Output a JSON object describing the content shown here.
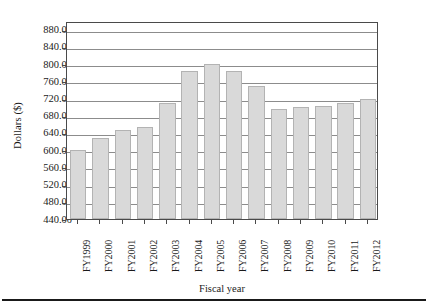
{
  "chart_data": {
    "type": "bar",
    "title": "",
    "xlabel": "Fiscal year",
    "ylabel": "Dollars ($)",
    "categories": [
      "FY1999",
      "FY2000",
      "FY2001",
      "FY2002",
      "FY2003",
      "FY2004",
      "FY2005",
      "FY2006",
      "FY2007",
      "FY2008",
      "FY2009",
      "FY2010",
      "FY2011",
      "FY2012"
    ],
    "values": [
      600,
      628,
      647,
      654,
      710,
      785,
      800,
      785,
      748,
      696,
      700,
      702,
      710,
      720
    ],
    "ylim": [
      440,
      900
    ],
    "ytick_labels": [
      "880.00",
      "840.00",
      "800.00",
      "760.00",
      "720.00",
      "680.00",
      "640.00",
      "600.00",
      "560.00",
      "520.00",
      "480.00",
      "440.00"
    ],
    "ytick_values": [
      880,
      840,
      800,
      760,
      720,
      680,
      640,
      600,
      560,
      520,
      480,
      440
    ],
    "grid": true,
    "legend": "none",
    "bar_color": "#d9d9d9",
    "bar_edge_color": "#b3b3b3",
    "axis_color": "#4a4a4a",
    "grid_color": "#8c8c8c"
  }
}
